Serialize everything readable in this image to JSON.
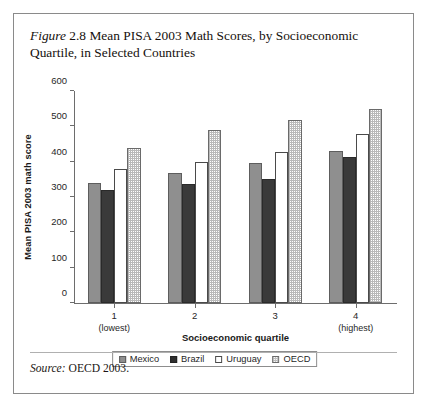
{
  "figure": {
    "label_word": "Figure",
    "caption": " 2.8 Mean PISA 2003 Math Scores, by Socioeconomic Quartile, in Selected Countries",
    "source_word": "Source:",
    "source_text": " OECD 2003."
  },
  "legend": {
    "items": [
      {
        "label": "Mexico",
        "key": "mexico",
        "color": "#8f8f8f"
      },
      {
        "label": "Brazil",
        "key": "brazil",
        "color": "#3a3a3a"
      },
      {
        "label": "Uruguay",
        "key": "uruguay",
        "color": "#ffffff"
      },
      {
        "label": "OECD",
        "key": "oecd",
        "color": "#e8e8e8"
      }
    ]
  },
  "chart_data": {
    "type": "bar",
    "title": "Mean PISA 2003 Math Scores, by Socioeconomic Quartile, in Selected Countries",
    "xlabel": "Socioeconomic quartile",
    "ylabel": "Mean PISA 2003 math score",
    "categories": [
      "1",
      "2",
      "3",
      "4"
    ],
    "category_sublabels": [
      "(lowest)",
      "",
      "",
      "(highest)"
    ],
    "series": [
      {
        "name": "Mexico",
        "values": [
          340,
          368,
          395,
          430
        ]
      },
      {
        "name": "Brazil",
        "values": [
          320,
          337,
          350,
          412
        ]
      },
      {
        "name": "Uruguay",
        "values": [
          378,
          400,
          427,
          478
        ]
      },
      {
        "name": "OECD",
        "values": [
          440,
          490,
          518,
          550
        ]
      }
    ],
    "ylim": [
      0,
      600
    ],
    "yticks": [
      0,
      100,
      200,
      300,
      400,
      500,
      600
    ],
    "grid": false,
    "legend_position": "bottom"
  }
}
